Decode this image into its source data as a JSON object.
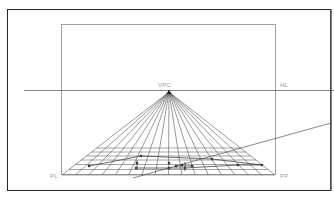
{
  "diagram": {
    "labels": {
      "vanishing_point": "VPC",
      "horizon_line": "HL",
      "left_base": "PL",
      "right_base": "PP"
    },
    "colors": {
      "outer_frame": "#2a2a2a",
      "inner_frame": "#8a8a8a",
      "lines": "#555555",
      "grid": "#666666",
      "label": "#9a9a9a",
      "points": "#333333"
    },
    "geometry": {
      "outer_frame": {
        "x": 7,
        "y": 9,
        "w": 324,
        "h": 182
      },
      "inner_frame": {
        "x": 61,
        "y": 24,
        "w": 215,
        "h": 151
      },
      "horizon_y": 90,
      "horizon_x1": 24,
      "horizon_x2": 334,
      "vp": {
        "x": 169,
        "y": 92
      },
      "base_y": 175,
      "base_x1": 62,
      "base_x2": 275,
      "ray_count": 17,
      "grid_rows_y": [
        148,
        152,
        156,
        160,
        164.5,
        169.5,
        175
      ],
      "diagonal": {
        "x1": 133,
        "y1": 178,
        "x2": 331,
        "y2": 123
      }
    },
    "points": [
      {
        "x": 89,
        "y": 166
      },
      {
        "x": 141,
        "y": 156
      },
      {
        "x": 137,
        "y": 163
      },
      {
        "x": 136,
        "y": 168
      },
      {
        "x": 169,
        "y": 163
      },
      {
        "x": 169,
        "y": 168
      },
      {
        "x": 176,
        "y": 166
      },
      {
        "x": 182,
        "y": 165
      },
      {
        "x": 185,
        "y": 168
      },
      {
        "x": 192,
        "y": 166
      },
      {
        "x": 212,
        "y": 159
      },
      {
        "x": 238,
        "y": 165
      },
      {
        "x": 262,
        "y": 165
      }
    ]
  }
}
